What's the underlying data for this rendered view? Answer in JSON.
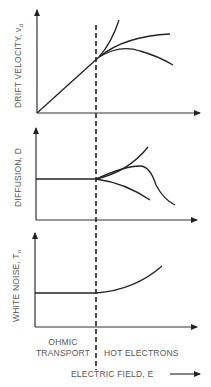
{
  "diagram": {
    "panels": [
      {
        "ylabel": "DRIFT VELOCITY, v",
        "ylabel_sub": "d"
      },
      {
        "ylabel": "DIFFUSION, D",
        "ylabel_sub": ""
      },
      {
        "ylabel": "WHITE NOISE, T",
        "ylabel_sub": "n"
      }
    ],
    "regions": {
      "left_line1": "OHMIC",
      "left_line2": "TRANSPORT",
      "right": "HOT ELECTRONS"
    },
    "xlabel": "ELECTRIC FIELD, E"
  }
}
